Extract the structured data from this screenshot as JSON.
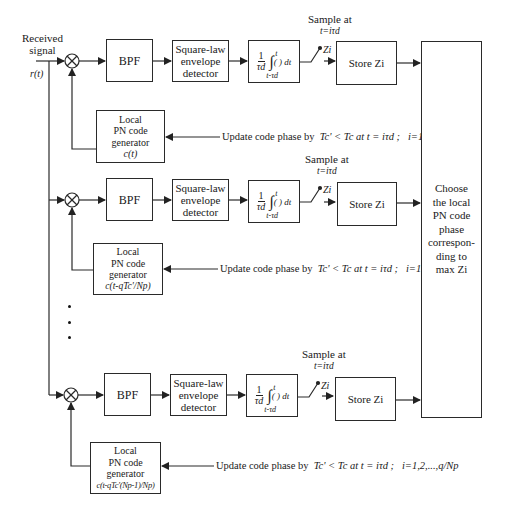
{
  "input": {
    "label_line1": "Received",
    "label_line2": "signal",
    "signal": "r(t)"
  },
  "branches": [
    {
      "bpf": "BPF",
      "detector": [
        "Square-law",
        "envelope",
        "detector"
      ],
      "integrator": {
        "num": "1",
        "den": "τd",
        "upper": "t",
        "lower": "t-τd",
        "body": "( ) dt"
      },
      "sample": {
        "line1": "Sample at",
        "line2": "t=iτd"
      },
      "switch_label": "Zi",
      "store": "Store Zi",
      "generator": {
        "line1": "Local",
        "line2": "PN code",
        "line3": "generator",
        "code": "c(t)"
      },
      "update": {
        "text": "Update code phase by",
        "math": "Tc' < Tc at t = iτd ;",
        "range": "i=1,2,...,q/Np"
      }
    },
    {
      "bpf": "BPF",
      "detector": [
        "Square-law",
        "envelope",
        "detector"
      ],
      "integrator": {
        "num": "1",
        "den": "τd",
        "upper": "t",
        "lower": "t-τd",
        "body": "( ) dt"
      },
      "sample": {
        "line1": "Sample at",
        "line2": "t=iτd"
      },
      "switch_label": "Zi",
      "store": "Store Zi",
      "generator": {
        "line1": "Local",
        "line2": "PN code",
        "line3": "generator",
        "code": "c(t-qTc'/Np)"
      },
      "update": {
        "text": "Update code phase by",
        "math": "Tc' < Tc at t = iτd ;",
        "range": "i=1,2,...,q/Np"
      }
    },
    {
      "bpf": "BPF",
      "detector": [
        "Square-law",
        "envelope",
        "detector"
      ],
      "integrator": {
        "num": "1",
        "den": "τd",
        "upper": "t",
        "lower": "t-τd",
        "body": "( ) dt"
      },
      "sample": {
        "line1": "Sample at",
        "line2": "t=iτd"
      },
      "switch_label": "Zi",
      "store": "Store Zi",
      "generator": {
        "line1": "Local",
        "line2": "PN code",
        "line3": "generator",
        "code": "c(t-qTc'(Np-1)/Np)"
      },
      "update": {
        "text": "Update code phase by",
        "math": "Tc' < Tc at t = iτd ;",
        "range": "i=1,2,...,q/Np"
      }
    }
  ],
  "decision": {
    "lines": [
      "Choose",
      "the local",
      "PN code",
      "phase",
      "correspon-",
      "ding to",
      "max Zi"
    ]
  },
  "ellipsis": "⋮",
  "colors": {
    "line": "#2a2a2a",
    "background": "#ffffff"
  }
}
